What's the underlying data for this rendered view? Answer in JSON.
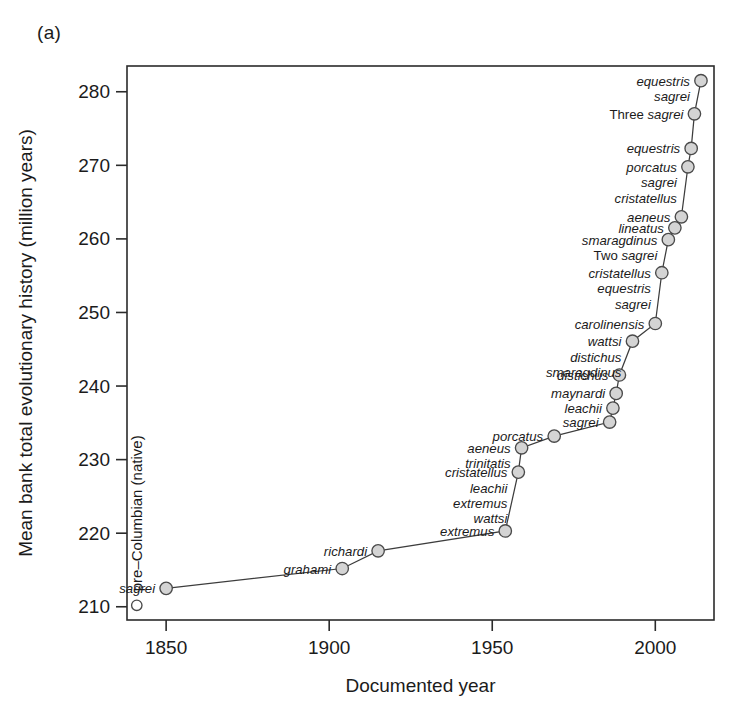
{
  "panel": {
    "tag": "(a)"
  },
  "chart_data": {
    "type": "line",
    "title": "",
    "xlabel": "Documented year",
    "ylabel": "Mean bank total evolutionary history (million years)",
    "xlim": [
      1838,
      2018
    ],
    "ylim": [
      208.2,
      283.5
    ],
    "xticks": [
      1850,
      1900,
      1950,
      2000
    ],
    "yticks": [
      210,
      220,
      230,
      240,
      250,
      260,
      270,
      280
    ],
    "grid": false,
    "legend": null,
    "marker_style": "filled-grey-circle",
    "native_point": {
      "label": "pre–Columbian (native)",
      "x": 1841,
      "y": 210.2,
      "marker_style": "open-circle"
    },
    "points": [
      {
        "x": 1850,
        "y": 212.5,
        "labels": [
          "sagrei"
        ],
        "label_pos": "above-left"
      },
      {
        "x": 1904,
        "y": 215.2,
        "labels": [
          "grahami"
        ],
        "label_pos": "above-left"
      },
      {
        "x": 1915,
        "y": 217.6,
        "labels": [
          "richardi"
        ],
        "label_pos": "above-left"
      },
      {
        "x": 1954,
        "y": 220.3,
        "labels": [
          "extremus"
        ],
        "label_pos": "left"
      },
      {
        "x": 1958,
        "y": 228.3,
        "labels": [
          "cristatellus",
          "leachii",
          "extremus",
          "wattsi"
        ],
        "label_pos": "left"
      },
      {
        "x": 1959,
        "y": 231.6,
        "labels": [
          "aeneus",
          "trinitatis"
        ],
        "label_pos": "left"
      },
      {
        "x": 1969,
        "y": 233.2,
        "labels": [
          "porcatus"
        ],
        "label_pos": "left"
      },
      {
        "x": 1986,
        "y": 235.1,
        "labels": [
          "sagrei"
        ],
        "label_pos": "left"
      },
      {
        "x": 1987,
        "y": 237.0,
        "labels": [
          "leachii"
        ],
        "label_pos": "left"
      },
      {
        "x": 1988,
        "y": 239.0,
        "labels": [
          "maynardi"
        ],
        "label_pos": "left"
      },
      {
        "x": 1989,
        "y": 241.5,
        "labels": [
          "distichus"
        ],
        "label_pos": "left"
      },
      {
        "x": 1993,
        "y": 246.1,
        "labels": [
          "wattsi",
          "distichus",
          "smaragdinus"
        ],
        "label_pos": "left"
      },
      {
        "x": 2000,
        "y": 248.5,
        "labels": [
          "carolinensis"
        ],
        "label_pos": "left"
      },
      {
        "x": 2002,
        "y": 255.4,
        "labels": [
          "cristatellus",
          "equestris",
          "sagrei"
        ],
        "label_pos": "left"
      },
      {
        "x": 2004,
        "y": 259.9,
        "labels": [
          "smaragdinus",
          "Two sagrei"
        ],
        "label_pos": "left"
      },
      {
        "x": 2006,
        "y": 261.5,
        "labels": [
          "lineatus"
        ],
        "label_pos": "left"
      },
      {
        "x": 2008,
        "y": 263.0,
        "labels": [
          "aeneus"
        ],
        "label_pos": "left"
      },
      {
        "x": 2010,
        "y": 269.8,
        "labels": [
          "porcatus",
          "sagrei",
          "cristatellus"
        ],
        "label_pos": "left"
      },
      {
        "x": 2011,
        "y": 272.3,
        "labels": [
          "equestris"
        ],
        "label_pos": "left"
      },
      {
        "x": 2012,
        "y": 277.0,
        "labels": [
          "Three sagrei"
        ],
        "label_pos": "left"
      },
      {
        "x": 2014,
        "y": 281.5,
        "labels": [
          "equestris",
          "sagrei"
        ],
        "label_pos": "left"
      }
    ]
  },
  "labels": {
    "sagrei": "sagrei",
    "grahami": "grahami",
    "richardi": "richardi",
    "extremus": "extremus",
    "cristatellus": "cristatellus",
    "leachii": "leachii",
    "wattsi": "wattsi",
    "aeneus": "aeneus",
    "trinitatis": "trinitatis",
    "porcatus": "porcatus",
    "maynardi": "maynardi",
    "distichus": "distichus",
    "smaragdinus": "smaragdinus",
    "carolinensis": "carolinensis",
    "equestris": "equestris",
    "lineatus": "lineatus",
    "two_sagrei": "Two sagrei",
    "three_sagrei": "Three sagrei",
    "native": "pre–Columbian (native)"
  },
  "colors": {
    "axis": "#2b2b2b",
    "line": "#3d3d3d",
    "marker_fill": "#d4d4d4",
    "marker_stroke": "#4a4a4a",
    "text": "#1b1b1b",
    "background": "#ffffff"
  }
}
